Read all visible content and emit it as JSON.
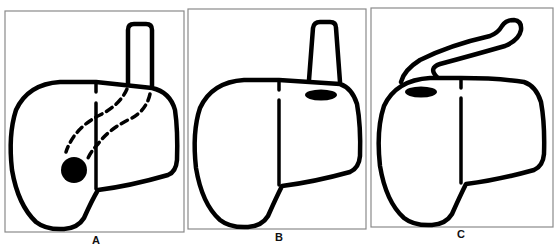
{
  "figure": {
    "panels": [
      {
        "id": "A",
        "label": "A",
        "frame": {
          "x": 5,
          "y": 11,
          "w": 179,
          "h": 221
        },
        "label_pos": {
          "x": 96,
          "y": 234
        },
        "features": [
          "vertical tube at top right",
          "dashed tract from tube to lesion",
          "round black lesion in lower left lobe"
        ]
      },
      {
        "id": "B",
        "label": "B",
        "frame": {
          "x": 188,
          "y": 9,
          "w": 178,
          "h": 220
        },
        "label_pos": {
          "x": 279,
          "y": 231
        },
        "features": [
          "vertical tube at top right",
          "oval black lesion in upper right lobe"
        ]
      },
      {
        "id": "C",
        "label": "C",
        "frame": {
          "x": 371,
          "y": 8,
          "w": 182,
          "h": 219
        },
        "label_pos": {
          "x": 461,
          "y": 229
        },
        "features": [
          "tube angled over top toward left",
          "oval black lesion in upper left lobe"
        ]
      }
    ],
    "colors": {
      "stroke": "#000000",
      "frame": "#8a8a8a",
      "background": "#ffffff"
    }
  }
}
